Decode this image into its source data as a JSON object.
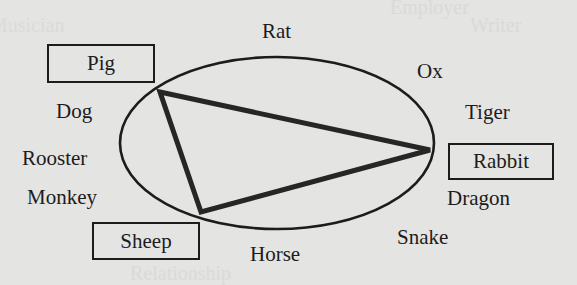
{
  "diagram": {
    "type": "zodiac-triangle",
    "ellipse": {
      "cx": 277,
      "cy": 143,
      "rx": 157,
      "ry": 86,
      "stroke": "#1c1c1c"
    },
    "triangle": {
      "vertices": [
        {
          "animal": "Pig",
          "x": 160,
          "y": 92
        },
        {
          "animal": "Rabbit",
          "x": 430,
          "y": 150
        },
        {
          "animal": "Sheep",
          "x": 201,
          "y": 212
        }
      ],
      "stroke": "#262626"
    },
    "animals": [
      {
        "name": "Rat",
        "boxed": false
      },
      {
        "name": "Ox",
        "boxed": false
      },
      {
        "name": "Tiger",
        "boxed": false
      },
      {
        "name": "Rabbit",
        "boxed": true
      },
      {
        "name": "Dragon",
        "boxed": false
      },
      {
        "name": "Snake",
        "boxed": false
      },
      {
        "name": "Horse",
        "boxed": false
      },
      {
        "name": "Sheep",
        "boxed": true
      },
      {
        "name": "Monkey",
        "boxed": false
      },
      {
        "name": "Rooster",
        "boxed": false
      },
      {
        "name": "Dog",
        "boxed": false
      },
      {
        "name": "Pig",
        "boxed": true
      }
    ]
  },
  "background_showthrough": [
    "Employer",
    "Writer",
    "Musician",
    "Relationship"
  ]
}
